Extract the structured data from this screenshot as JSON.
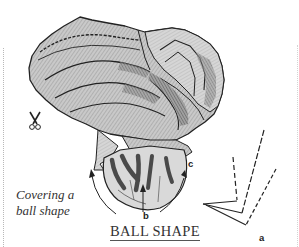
{
  "figure": {
    "title": "BALL SHAPE",
    "caption_line1": "Covering a",
    "caption_line2": "ball shape",
    "labels": {
      "a": "a",
      "b": "b",
      "c": "c"
    },
    "icons": [
      "scissors-icon",
      "arrow-left-curve",
      "arrow-right-curve",
      "arrow-up-center",
      "fold-angle-diagram"
    ],
    "colors": {
      "fabric_fill": "#c8c8c8",
      "fabric_shadow": "#6a6a6a",
      "outline": "#222222",
      "ribbon": "#555555",
      "background": "#ffffff"
    }
  }
}
